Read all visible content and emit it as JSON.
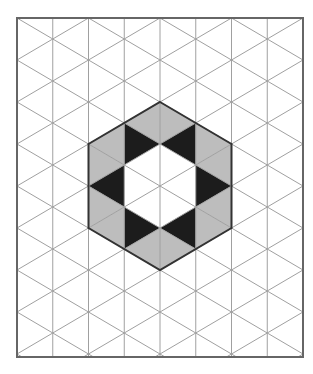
{
  "diagram": {
    "type": "isometric-triangle-grid",
    "frame": {
      "x": 17,
      "y": 18,
      "width": 286,
      "height": 339
    },
    "grid": {
      "columns_x": [
        17,
        52.75,
        88.5,
        124.25,
        160,
        195.75,
        231.5,
        267.25,
        303
      ],
      "row_step": 42,
      "even_column_vertex_offset_y": 18,
      "odd_column_vertex_offset_y": 39
    },
    "colors": {
      "background": "#ffffff",
      "grid_line": "#a0a0a0",
      "frame": "#666666",
      "hexagon_outline": "#333333",
      "gray_fill": "#bdbdbd",
      "black_fill": "#1c1c1c",
      "white_fill": "#ffffff"
    },
    "hexagon": {
      "vertices": [
        [
          160,
          102
        ],
        [
          231.5,
          144
        ],
        [
          231.5,
          228
        ],
        [
          160,
          270
        ],
        [
          88.5,
          228
        ],
        [
          88.5,
          144
        ]
      ]
    },
    "triangles": [
      {
        "fill": "gray",
        "points": [
          [
            160,
            102
          ],
          [
            124.25,
            123
          ],
          [
            160,
            144
          ]
        ]
      },
      {
        "fill": "black",
        "points": [
          [
            124.25,
            123
          ],
          [
            160,
            144
          ],
          [
            124.25,
            165
          ]
        ]
      },
      {
        "fill": "white",
        "points": [
          [
            160,
            144
          ],
          [
            124.25,
            165
          ],
          [
            160,
            186
          ]
        ]
      },
      {
        "fill": "white",
        "points": [
          [
            124.25,
            165
          ],
          [
            160,
            186
          ],
          [
            124.25,
            207
          ]
        ]
      },
      {
        "fill": "white",
        "points": [
          [
            160,
            186
          ],
          [
            124.25,
            207
          ],
          [
            160,
            228
          ]
        ]
      },
      {
        "fill": "black",
        "points": [
          [
            124.25,
            207
          ],
          [
            160,
            228
          ],
          [
            124.25,
            249
          ]
        ]
      },
      {
        "fill": "gray",
        "points": [
          [
            160,
            228
          ],
          [
            124.25,
            249
          ],
          [
            160,
            270
          ]
        ]
      },
      {
        "fill": "gray",
        "points": [
          [
            124.25,
            123
          ],
          [
            88.5,
            144
          ],
          [
            124.25,
            165
          ]
        ]
      },
      {
        "fill": "gray",
        "points": [
          [
            88.5,
            144
          ],
          [
            124.25,
            165
          ],
          [
            88.5,
            186
          ]
        ]
      },
      {
        "fill": "black",
        "points": [
          [
            124.25,
            165
          ],
          [
            88.5,
            186
          ],
          [
            124.25,
            207
          ]
        ]
      },
      {
        "fill": "gray",
        "points": [
          [
            88.5,
            186
          ],
          [
            124.25,
            207
          ],
          [
            88.5,
            228
          ]
        ]
      },
      {
        "fill": "gray",
        "points": [
          [
            124.25,
            207
          ],
          [
            88.5,
            228
          ],
          [
            124.25,
            249
          ]
        ]
      },
      {
        "fill": "gray",
        "points": [
          [
            160,
            102
          ],
          [
            195.75,
            123
          ],
          [
            160,
            144
          ]
        ]
      },
      {
        "fill": "black",
        "points": [
          [
            195.75,
            123
          ],
          [
            160,
            144
          ],
          [
            195.75,
            165
          ]
        ]
      },
      {
        "fill": "white",
        "points": [
          [
            160,
            144
          ],
          [
            195.75,
            165
          ],
          [
            160,
            186
          ]
        ]
      },
      {
        "fill": "white",
        "points": [
          [
            195.75,
            165
          ],
          [
            160,
            186
          ],
          [
            195.75,
            207
          ]
        ]
      },
      {
        "fill": "white",
        "points": [
          [
            160,
            186
          ],
          [
            195.75,
            207
          ],
          [
            160,
            228
          ]
        ]
      },
      {
        "fill": "black",
        "points": [
          [
            195.75,
            207
          ],
          [
            160,
            228
          ],
          [
            195.75,
            249
          ]
        ]
      },
      {
        "fill": "gray",
        "points": [
          [
            160,
            228
          ],
          [
            195.75,
            249
          ],
          [
            160,
            270
          ]
        ]
      },
      {
        "fill": "gray",
        "points": [
          [
            195.75,
            123
          ],
          [
            231.5,
            144
          ],
          [
            195.75,
            165
          ]
        ]
      },
      {
        "fill": "gray",
        "points": [
          [
            231.5,
            144
          ],
          [
            195.75,
            165
          ],
          [
            231.5,
            186
          ]
        ]
      },
      {
        "fill": "black",
        "points": [
          [
            195.75,
            165
          ],
          [
            231.5,
            186
          ],
          [
            195.75,
            207
          ]
        ]
      },
      {
        "fill": "gray",
        "points": [
          [
            231.5,
            186
          ],
          [
            195.75,
            207
          ],
          [
            231.5,
            228
          ]
        ]
      },
      {
        "fill": "gray",
        "points": [
          [
            195.75,
            207
          ],
          [
            231.5,
            228
          ],
          [
            195.75,
            249
          ]
        ]
      }
    ],
    "counts": {
      "black": 6,
      "gray": 12,
      "white": 6
    }
  }
}
